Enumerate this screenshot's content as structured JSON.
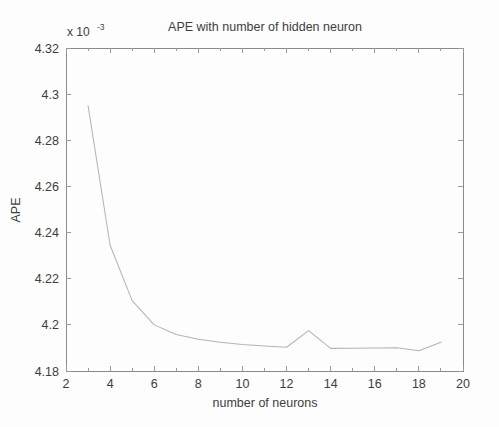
{
  "figure": {
    "name": "ape-vs-hidden-neurons-figure",
    "background_color": "#fdfdfd",
    "axis_color": "#8a8a8a",
    "line_color": "#b4b4b4"
  },
  "chart_data": {
    "type": "line",
    "title": "APE with number of hidden neuron",
    "xlabel": "number of neurons",
    "ylabel": "APE",
    "y_exponent_label": "x 10",
    "y_exponent_power": "-3",
    "y_scale_factor": 0.001,
    "xlim": [
      2,
      20
    ],
    "ylim": [
      4.18,
      4.32
    ],
    "xticks": [
      2,
      4,
      6,
      8,
      10,
      12,
      14,
      16,
      18,
      20
    ],
    "xtick_labels": [
      "2",
      "4",
      "6",
      "8",
      "10",
      "12",
      "14",
      "16",
      "18",
      "20"
    ],
    "x_minor_ticks": [
      3,
      5,
      7,
      9,
      11,
      13,
      15,
      17,
      19
    ],
    "yticks": [
      4.18,
      4.2,
      4.22,
      4.24,
      4.26,
      4.28,
      4.3,
      4.32
    ],
    "ytick_labels": [
      "4.18",
      "4.2",
      "4.22",
      "4.24",
      "4.26",
      "4.28",
      "4.3",
      "4.32"
    ],
    "grid": false,
    "legend": null,
    "box": true,
    "tick_direction": "in",
    "series": [
      {
        "name": "APE",
        "x": [
          3,
          4,
          5,
          6,
          7,
          8,
          9,
          10,
          11,
          12,
          13,
          14,
          15,
          16,
          17,
          18,
          19
        ],
        "values": [
          4.295,
          4.2345,
          4.2105,
          4.2,
          4.1958,
          4.1938,
          4.1925,
          4.1915,
          4.1908,
          4.1903,
          4.1975,
          4.1898,
          4.1899,
          4.19,
          4.1901,
          4.1888,
          4.1925
        ]
      }
    ],
    "annotations": [
      "steep decline from 3 to 6 neurons",
      "plateau near 4.19e-3 between 8 and 12 neurons",
      "local spike at 13 neurons",
      "slight dip at 18 neurons then rise at 19"
    ]
  }
}
